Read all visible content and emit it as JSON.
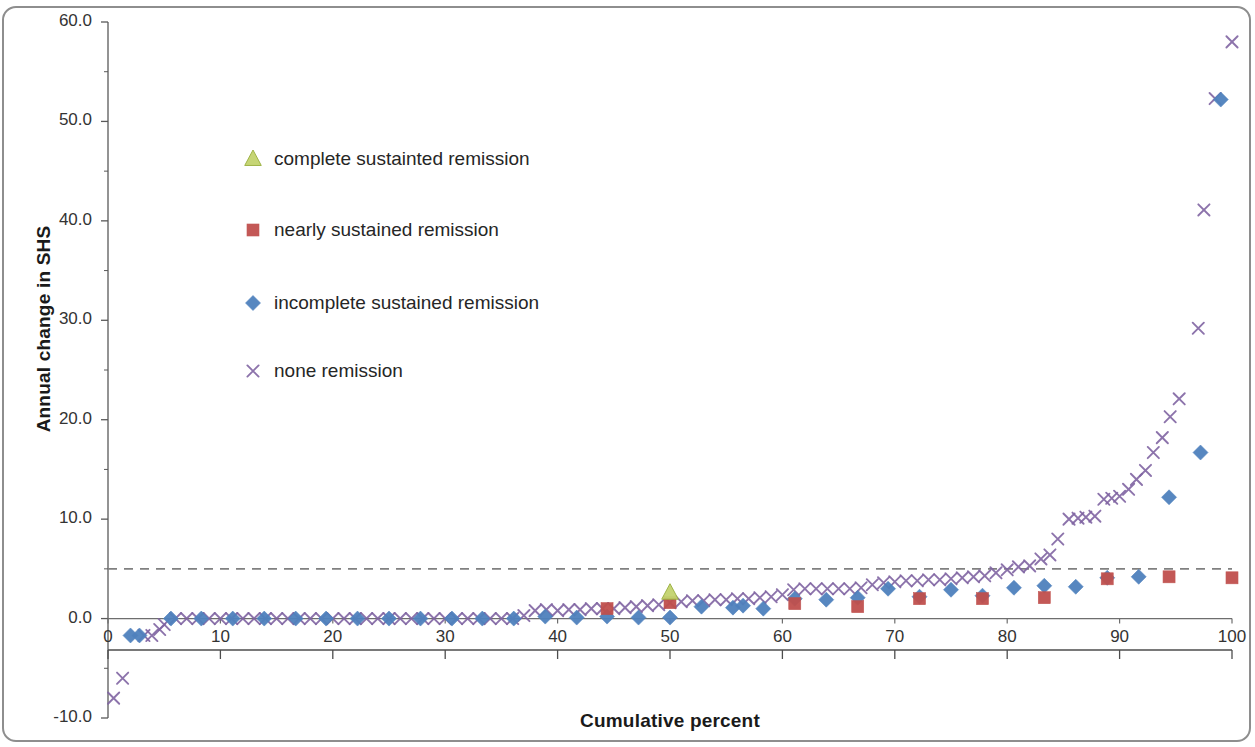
{
  "chart_data": {
    "type": "scatter",
    "title": "",
    "xlabel": "Cumulative percent",
    "ylabel": "Annual change in SHS",
    "xlim": [
      0,
      100
    ],
    "ylim": [
      -10,
      60
    ],
    "xticks": [
      "0",
      "10",
      "20",
      "30",
      "40",
      "50",
      "60",
      "70",
      "80",
      "90",
      "100"
    ],
    "yticks": [
      "-10.0",
      "0.0",
      "10.0",
      "20.0",
      "30.0",
      "40.0",
      "50.0",
      "60.0"
    ],
    "x_tick_step": 10,
    "y_tick_step": 10,
    "y_minor_tick_step": 5,
    "grid": false,
    "legend_position": "upper-left-inside",
    "reference_line": {
      "name": "threshold-line",
      "value": 5.0,
      "style": "dashed",
      "color": "#808080",
      "orientation": "horizontal"
    },
    "series": [
      {
        "name": "complete sustainted remission",
        "marker": "triangle",
        "color": "#c3d36e",
        "points": [
          [
            50.0,
            2.6
          ]
        ]
      },
      {
        "name": "nearly sustained remission",
        "marker": "square",
        "color": "#c0504d",
        "points": [
          [
            44.4,
            1.0
          ],
          [
            50.0,
            1.6
          ],
          [
            61.1,
            1.5
          ],
          [
            66.7,
            1.2
          ],
          [
            72.2,
            2.0
          ],
          [
            77.8,
            2.0
          ],
          [
            83.3,
            2.1
          ],
          [
            88.9,
            4.0
          ],
          [
            94.4,
            4.2
          ],
          [
            100.0,
            4.1
          ]
        ]
      },
      {
        "name": "incomplete sustained remission",
        "marker": "diamond",
        "color": "#4f81bd",
        "points": [
          [
            2.0,
            -1.7
          ],
          [
            2.8,
            -1.7
          ],
          [
            5.6,
            0.0
          ],
          [
            8.3,
            0.0
          ],
          [
            11.1,
            0.0
          ],
          [
            13.9,
            0.0
          ],
          [
            16.7,
            0.0
          ],
          [
            19.4,
            0.0
          ],
          [
            22.2,
            0.0
          ],
          [
            25.0,
            0.0
          ],
          [
            27.8,
            0.0
          ],
          [
            30.6,
            0.0
          ],
          [
            33.3,
            0.0
          ],
          [
            36.1,
            0.0
          ],
          [
            38.9,
            0.2
          ],
          [
            41.7,
            0.1
          ],
          [
            44.4,
            0.2
          ],
          [
            47.2,
            0.1
          ],
          [
            50.0,
            0.1
          ],
          [
            52.8,
            1.2
          ],
          [
            55.6,
            1.1
          ],
          [
            56.5,
            1.3
          ],
          [
            58.3,
            1.0
          ],
          [
            61.1,
            2.0
          ],
          [
            63.9,
            1.9
          ],
          [
            66.7,
            2.1
          ],
          [
            69.4,
            3.0
          ],
          [
            72.2,
            2.2
          ],
          [
            75.0,
            2.9
          ],
          [
            77.8,
            2.3
          ],
          [
            80.6,
            3.1
          ],
          [
            83.3,
            3.3
          ],
          [
            86.1,
            3.2
          ],
          [
            88.9,
            4.1
          ],
          [
            91.7,
            4.2
          ],
          [
            94.4,
            12.2
          ],
          [
            97.2,
            16.7
          ],
          [
            99.0,
            52.2
          ]
        ]
      },
      {
        "name": "none remission",
        "marker": "x",
        "color": "#8064a2",
        "points": [
          [
            0.5,
            -8.0
          ],
          [
            1.3,
            -6.0
          ],
          [
            3.2,
            -1.7
          ],
          [
            3.9,
            -1.7
          ],
          [
            4.6,
            -1.1
          ],
          [
            5.0,
            -0.6
          ],
          [
            6.0,
            0.0
          ],
          [
            7.0,
            0.0
          ],
          [
            8.0,
            0.0
          ],
          [
            9.0,
            0.0
          ],
          [
            10.0,
            0.0
          ],
          [
            11.0,
            0.0
          ],
          [
            12.0,
            0.0
          ],
          [
            13.0,
            0.0
          ],
          [
            14.0,
            0.0
          ],
          [
            15.0,
            0.0
          ],
          [
            16.0,
            0.0
          ],
          [
            17.0,
            0.0
          ],
          [
            18.0,
            0.0
          ],
          [
            19.0,
            0.0
          ],
          [
            20.0,
            0.0
          ],
          [
            21.0,
            0.0
          ],
          [
            22.0,
            0.0
          ],
          [
            23.0,
            0.0
          ],
          [
            24.0,
            0.0
          ],
          [
            25.0,
            0.0
          ],
          [
            26.0,
            0.0
          ],
          [
            27.0,
            0.0
          ],
          [
            28.0,
            0.0
          ],
          [
            29.0,
            0.0
          ],
          [
            30.0,
            0.0
          ],
          [
            31.0,
            0.0
          ],
          [
            32.0,
            0.0
          ],
          [
            33.0,
            0.0
          ],
          [
            34.0,
            0.0
          ],
          [
            35.0,
            0.0
          ],
          [
            36.0,
            0.0
          ],
          [
            37.0,
            0.3
          ],
          [
            38.0,
            0.8
          ],
          [
            39.0,
            0.9
          ],
          [
            40.0,
            0.8
          ],
          [
            41.0,
            0.9
          ],
          [
            42.0,
            0.9
          ],
          [
            43.0,
            1.0
          ],
          [
            44.0,
            1.0
          ],
          [
            45.0,
            1.0
          ],
          [
            46.0,
            1.1
          ],
          [
            47.0,
            1.2
          ],
          [
            48.0,
            1.3
          ],
          [
            49.0,
            1.4
          ],
          [
            50.0,
            1.6
          ],
          [
            51.0,
            1.7
          ],
          [
            52.0,
            1.8
          ],
          [
            53.0,
            1.8
          ],
          [
            54.0,
            1.9
          ],
          [
            55.0,
            1.9
          ],
          [
            56.0,
            2.0
          ],
          [
            57.0,
            2.0
          ],
          [
            58.0,
            2.1
          ],
          [
            59.0,
            2.2
          ],
          [
            60.0,
            2.4
          ],
          [
            61.0,
            2.9
          ],
          [
            62.0,
            3.0
          ],
          [
            63.0,
            3.0
          ],
          [
            64.0,
            3.0
          ],
          [
            65.0,
            3.0
          ],
          [
            66.0,
            3.0
          ],
          [
            67.0,
            3.1
          ],
          [
            68.0,
            3.4
          ],
          [
            69.0,
            3.6
          ],
          [
            70.0,
            3.7
          ],
          [
            71.0,
            3.8
          ],
          [
            72.0,
            3.8
          ],
          [
            73.0,
            3.9
          ],
          [
            74.0,
            3.9
          ],
          [
            75.0,
            4.0
          ],
          [
            76.0,
            4.1
          ],
          [
            77.0,
            4.2
          ],
          [
            78.0,
            4.3
          ],
          [
            79.0,
            4.6
          ],
          [
            80.0,
            4.9
          ],
          [
            81.0,
            5.2
          ],
          [
            82.0,
            5.3
          ],
          [
            83.0,
            6.0
          ],
          [
            83.8,
            6.4
          ],
          [
            84.5,
            8.0
          ],
          [
            85.5,
            10.0
          ],
          [
            86.3,
            10.1
          ],
          [
            87.0,
            10.2
          ],
          [
            87.8,
            10.3
          ],
          [
            88.6,
            12.0
          ],
          [
            89.3,
            12.1
          ],
          [
            90.0,
            12.3
          ],
          [
            90.8,
            13.0
          ],
          [
            91.5,
            14.0
          ],
          [
            92.3,
            14.9
          ],
          [
            93.0,
            16.7
          ],
          [
            93.8,
            18.2
          ],
          [
            94.5,
            20.3
          ],
          [
            95.3,
            22.1
          ],
          [
            97.0,
            29.2
          ],
          [
            97.5,
            41.1
          ],
          [
            98.5,
            52.3
          ],
          [
            100.0,
            58.0
          ]
        ]
      }
    ]
  },
  "legend": {
    "items": [
      {
        "label": "complete sustainted remission",
        "marker": "triangle",
        "color": "#c3d36e"
      },
      {
        "label": "nearly sustained remission",
        "marker": "square",
        "color": "#c0504d"
      },
      {
        "label": "incomplete sustained remission",
        "marker": "diamond",
        "color": "#4f81bd"
      },
      {
        "label": "none remission",
        "marker": "x",
        "color": "#8064a2"
      }
    ]
  },
  "axes": {
    "x_title": "Cumulative percent",
    "y_title": "Annual change in SHS"
  }
}
